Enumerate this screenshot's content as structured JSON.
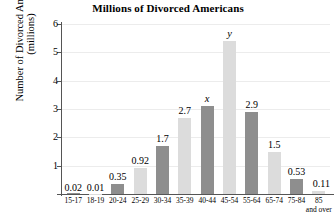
{
  "chart_data": {
    "type": "bar",
    "title": "Millions of Divorced Americans",
    "xlabel": "",
    "ylabel_line1": "Number of Divorced Americans",
    "ylabel_line2": "(millions)",
    "ylim": [
      0,
      6
    ],
    "yticks": [
      1,
      2,
      3,
      4,
      5,
      6
    ],
    "grid": true,
    "legend": "none",
    "categories": [
      "15-17",
      "18-19",
      "20-24",
      "25-29",
      "30-34",
      "35-39",
      "40-44",
      "45-54",
      "55-64",
      "65-74",
      "75-84",
      "85"
    ],
    "category_sublabels": [
      "",
      "",
      "",
      "",
      "",
      "",
      "",
      "",
      "",
      "",
      "",
      "and over"
    ],
    "values": [
      0.02,
      0.01,
      0.35,
      0.92,
      1.7,
      2.7,
      3.1,
      5.4,
      2.9,
      1.5,
      0.53,
      0.11
    ],
    "labels": [
      "0.02",
      "0.01",
      "0.35",
      "0.92",
      "1.7",
      "2.7",
      "x",
      "y",
      "2.9",
      "1.5",
      "0.53",
      "0.11"
    ],
    "label_is_variable": [
      false,
      false,
      false,
      false,
      false,
      false,
      true,
      true,
      false,
      false,
      false,
      false
    ],
    "bar_colors": [
      "#8e8e8e",
      "#dcdcdc",
      "#8e8e8e",
      "#dcdcdc",
      "#8e8e8e",
      "#dcdcdc",
      "#8e8e8e",
      "#dcdcdc",
      "#8e8e8e",
      "#dcdcdc",
      "#8e8e8e",
      "#dcdcdc"
    ],
    "colors": {
      "dark_bar": "#8e8e8e",
      "light_bar": "#dcdcdc",
      "axis": "#555555",
      "grid": "#ececec",
      "text": "#000000",
      "background": "#ffffff"
    }
  }
}
